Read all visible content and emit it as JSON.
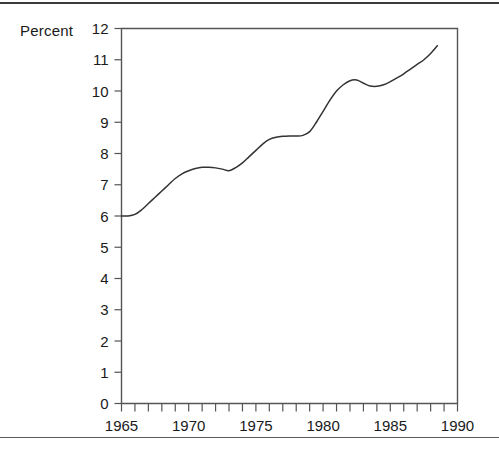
{
  "chart_data": {
    "type": "line",
    "title": "",
    "xlabel": "",
    "ylabel": "Percent",
    "ylabel_text": "Percent",
    "xlim": [
      1965,
      1990
    ],
    "ylim": [
      0,
      12
    ],
    "grid": false,
    "legend": "none",
    "y_ticks": [
      0,
      1,
      2,
      3,
      4,
      5,
      6,
      7,
      8,
      9,
      10,
      11,
      12
    ],
    "y_tick_labels": [
      "0",
      "1",
      "2",
      "3",
      "4",
      "5",
      "6",
      "7",
      "8",
      "9",
      "10",
      "11",
      "12"
    ],
    "x_ticks": [
      1965,
      1966,
      1967,
      1968,
      1969,
      1970,
      1971,
      1972,
      1973,
      1974,
      1975,
      1976,
      1977,
      1978,
      1979,
      1980,
      1981,
      1982,
      1983,
      1984,
      1985,
      1986,
      1987,
      1988,
      1989,
      1990
    ],
    "x_tick_labels_shown": [
      "1965",
      "1970",
      "1975",
      "1980",
      "1985",
      "1990"
    ],
    "x_tick_labels_positions": [
      1965,
      1970,
      1975,
      1980,
      1985,
      1990
    ],
    "series": [
      {
        "name": "Percent",
        "color": "#333333",
        "x": [
          1965.0,
          1965.5,
          1966.0,
          1966.5,
          1967.0,
          1967.5,
          1968.0,
          1968.5,
          1969.0,
          1969.5,
          1970.0,
          1970.5,
          1971.0,
          1971.5,
          1972.0,
          1972.5,
          1973.0,
          1973.5,
          1974.0,
          1974.5,
          1975.0,
          1975.5,
          1976.0,
          1976.5,
          1977.0,
          1977.5,
          1978.0,
          1978.5,
          1979.0,
          1979.5,
          1980.0,
          1980.5,
          1981.0,
          1981.5,
          1982.0,
          1982.5,
          1983.0,
          1983.5,
          1984.0,
          1984.5,
          1985.0,
          1985.5,
          1986.0,
          1986.5,
          1987.0,
          1987.5,
          1988.0,
          1988.5
        ],
        "y": [
          6.0,
          6.0,
          6.05,
          6.2,
          6.4,
          6.6,
          6.8,
          7.0,
          7.2,
          7.35,
          7.45,
          7.52,
          7.56,
          7.56,
          7.54,
          7.5,
          7.45,
          7.55,
          7.7,
          7.9,
          8.1,
          8.3,
          8.45,
          8.52,
          8.55,
          8.56,
          8.56,
          8.58,
          8.7,
          9.0,
          9.35,
          9.7,
          10.0,
          10.2,
          10.33,
          10.35,
          10.25,
          10.16,
          10.15,
          10.2,
          10.3,
          10.42,
          10.55,
          10.7,
          10.85,
          11.0,
          11.2,
          11.45
        ]
      }
    ],
    "annotations": []
  }
}
